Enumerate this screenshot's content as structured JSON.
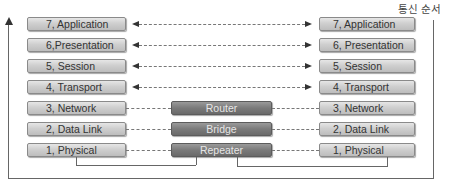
{
  "diagram": {
    "direction_label": "통신 순서",
    "left_stack": [
      {
        "label": "7, Application"
      },
      {
        "label": "6,Presentation"
      },
      {
        "label": "5, Session"
      },
      {
        "label": "4, Transport"
      },
      {
        "label": "3, Network"
      },
      {
        "label": "2, Data Link"
      },
      {
        "label": "1, Physical"
      }
    ],
    "right_stack": [
      {
        "label": "7, Application"
      },
      {
        "label": "6, Presentation"
      },
      {
        "label": "5, Session"
      },
      {
        "label": "4, Transport"
      },
      {
        "label": "3, Network"
      },
      {
        "label": "2, Data Link"
      },
      {
        "label": "1, Physical"
      }
    ],
    "devices": [
      {
        "label": "Router",
        "layer": 3
      },
      {
        "label": "Bridge",
        "layer": 2
      },
      {
        "label": "Repeater",
        "layer": 1
      }
    ],
    "colors": {
      "layer_box": "#cfcfcf",
      "device_box": "#7a7a7a",
      "line": "#666666"
    }
  }
}
